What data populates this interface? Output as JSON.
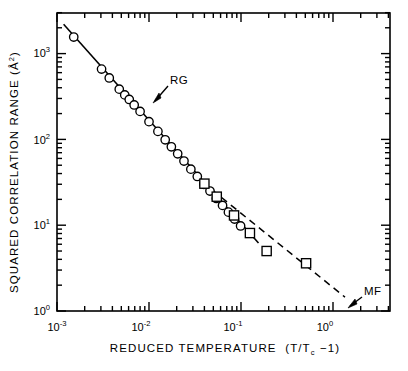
{
  "figure": {
    "title": "",
    "background_color": "#ffffff",
    "foreground_color": "#000000"
  },
  "axes": {
    "x": {
      "label_main": "REDUCED  TEMPERATURE",
      "label_paren_open": "(T/T",
      "label_sub": "c",
      "label_paren_close": " −1)",
      "label_full": "REDUCED TEMPERATURE (T/Tc −1)",
      "scale": "log",
      "ticks": [
        {
          "value": 0.001,
          "mantissa": "10",
          "exponent": "-3"
        },
        {
          "value": 0.01,
          "mantissa": "10",
          "exponent": "-2"
        },
        {
          "value": 0.1,
          "mantissa": "10",
          "exponent": "-1"
        },
        {
          "value": 1.0,
          "mantissa": "10",
          "exponent": "0"
        }
      ],
      "range": [
        0.001,
        5.0
      ]
    },
    "y": {
      "label_main": "SQUARED  CORRELATION  RANGE",
      "label_unit_open": "(Å",
      "label_unit_exp": "2",
      "label_unit_close": ")",
      "label_full": "SQUARED CORRELATION RANGE (Å²)",
      "scale": "log",
      "ticks": [
        {
          "value": 1000,
          "mantissa": "10",
          "exponent": "3"
        },
        {
          "value": 100,
          "mantissa": "10",
          "exponent": "2"
        },
        {
          "value": 10,
          "mantissa": "10",
          "exponent": "1"
        },
        {
          "value": 1,
          "mantissa": "10",
          "exponent": "0"
        }
      ],
      "range": [
        1,
        2900
      ]
    }
  },
  "annotations": [
    {
      "id": "rg",
      "text": "RG",
      "meaning": "renormalization-group line",
      "x": 0.028,
      "y": 300
    },
    {
      "id": "mf",
      "text": "MF",
      "meaning": "mean-field line",
      "x": 2.1,
      "y": 3.1
    }
  ],
  "chart_data": {
    "type": "scatter",
    "title": "",
    "xlabel": "REDUCED TEMPERATURE (T/Tc −1)",
    "ylabel": "SQUARED CORRELATION RANGE (Å²)",
    "xscale": "log",
    "yscale": "log",
    "xlim": [
      0.001,
      5.0
    ],
    "ylim": [
      1,
      2900
    ],
    "grid": false,
    "legend": "none",
    "series": [
      {
        "name": "circles",
        "marker": "open-circle",
        "points": [
          {
            "x": 0.00152,
            "y": 1560
          },
          {
            "x": 0.00305,
            "y": 660
          },
          {
            "x": 0.0037,
            "y": 520
          },
          {
            "x": 0.00475,
            "y": 385
          },
          {
            "x": 0.00545,
            "y": 330
          },
          {
            "x": 0.0061,
            "y": 292
          },
          {
            "x": 0.0069,
            "y": 252
          },
          {
            "x": 0.008,
            "y": 212
          },
          {
            "x": 0.01,
            "y": 161
          },
          {
            "x": 0.0125,
            "y": 124
          },
          {
            "x": 0.015,
            "y": 99
          },
          {
            "x": 0.0175,
            "y": 82
          },
          {
            "x": 0.0205,
            "y": 68
          },
          {
            "x": 0.024,
            "y": 56
          },
          {
            "x": 0.0285,
            "y": 45
          },
          {
            "x": 0.0335,
            "y": 37
          },
          {
            "x": 0.0395,
            "y": 30
          },
          {
            "x": 0.046,
            "y": 25
          },
          {
            "x": 0.054,
            "y": 20.5
          },
          {
            "x": 0.063,
            "y": 17.0
          },
          {
            "x": 0.073,
            "y": 14.2
          },
          {
            "x": 0.085,
            "y": 11.8
          },
          {
            "x": 0.099,
            "y": 9.8
          }
        ]
      },
      {
        "name": "squares",
        "marker": "open-square",
        "points": [
          {
            "x": 0.04,
            "y": 30.5
          },
          {
            "x": 0.0545,
            "y": 21.5
          },
          {
            "x": 0.084,
            "y": 13.0
          },
          {
            "x": 0.125,
            "y": 8.1
          },
          {
            "x": 0.19,
            "y": 5.0
          },
          {
            "x": 0.51,
            "y": 3.6
          }
        ]
      }
    ],
    "lines": [
      {
        "name": "RG",
        "style": "solid",
        "x_start": 0.00118,
        "y_start": 2200,
        "x_end": 0.155,
        "y_end": 6.2,
        "slope": -1.24,
        "label": "RG"
      },
      {
        "name": "MF",
        "style": "dashed",
        "x_start": 0.0385,
        "y_start": 31.5,
        "x_end": 1.35,
        "y_end": 1.45,
        "slope": -0.87,
        "label": "MF"
      }
    ]
  }
}
